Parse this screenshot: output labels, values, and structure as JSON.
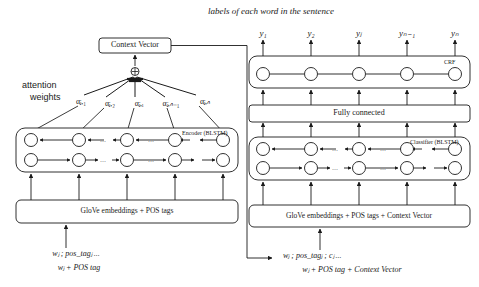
{
  "figure": {
    "title_right": "labels of each word in the sentence",
    "attention_label_line1": "attention",
    "attention_label_line2": "weights"
  },
  "colors": {
    "stroke": "#1a1a1a",
    "background": "#ffffff",
    "text": "#1a1a1a"
  },
  "left_branch": {
    "context_vector_box": "Context Vector",
    "sum_node_symbol": "⊕",
    "encoder_box_label": "Encoder (BLSTM)",
    "embedding_box_label": "GloVe embeddings + POS tags",
    "input_line1": "wⱼ ; pos_tagⱼ  ...",
    "input_line2": "wⱼ + POS tag",
    "attention_weights": [
      "αⱼ,₁",
      "αⱼ,₂",
      "αⱼ,ᵢ",
      "αⱼ,ₙ₋₁",
      "αⱼ,ₙ"
    ],
    "ellipsis": "..."
  },
  "right_branch": {
    "crf_box_label": "CRF",
    "fully_connected_box": "Fully connected",
    "classifier_box_label": "Classifier (BLSTM)",
    "embedding_box_label": "GloVe embeddings + POS tags + Context Vector",
    "input_line1": "wⱼ ; pos_tagⱼ ; cⱼ  ...",
    "input_line2": "wⱼ + POS tag + Context Vector",
    "output_labels": [
      "y₁",
      "y₂",
      "yⱼ",
      "yₙ₋₁",
      "yₙ"
    ]
  },
  "structure": {
    "node_count_per_row": 5,
    "blstm_rows": 2,
    "backward_row_direction": "left",
    "forward_row_direction": "right"
  }
}
